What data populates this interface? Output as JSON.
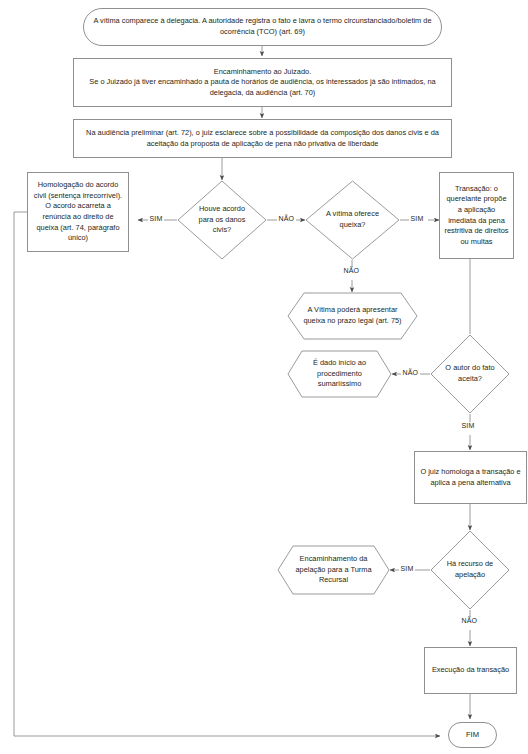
{
  "diagram": {
    "stroke_color": "#8d8f91",
    "text_color": "#231f20",
    "background": "#ffffff"
  },
  "nodes": {
    "start": {
      "shape": "pill",
      "text": "A vítima comparece à delegacia. A autoridade registra o fato e lavra o termo circunstanciado/boletim de ocorrência (TCO) (art. 69)"
    },
    "encaminhamento": {
      "shape": "rect",
      "text": "Encaminhamento ao Juizado.\nSe o Juizado já tiver encaminhado a pauta de horários de audiência, os interessados já são intimados, na delegacia, da audiência (art. 70)"
    },
    "audiencia_preliminar": {
      "shape": "rect",
      "text": "Na audiência preliminar (art. 72), o juiz esclarece sobre a possibilidade da composição dos danos civis e da aceitação da proposta de aplicação de pena não privativa de liberdade"
    },
    "homologacao": {
      "shape": "rect",
      "text": "Homologação do acordo civil (sentença irrecorrível). O acordo acarreta a renúncia ao direito de queixa (art. 74, parágrafo único)"
    },
    "houve_acordo": {
      "shape": "diamond",
      "text": "Houve acordo para os danos civis?"
    },
    "oferece_queixa": {
      "shape": "diamond",
      "text": "A vítima oferece queixa?"
    },
    "transacao": {
      "shape": "rect",
      "text": "Transação: o querelante propõe a aplicação imediata da pena restritiva de direitos ou multas"
    },
    "vitima_podera": {
      "shape": "hexagon",
      "text": "A Vítima poderá apresentar queixa no prazo legal (art. 75)"
    },
    "dado_inicio": {
      "shape": "hexagon",
      "text": "É dado início ao procedimento sumariíssimo"
    },
    "autor_aceita": {
      "shape": "diamond",
      "text": "O autor do fato aceita?"
    },
    "juiz_homologa": {
      "shape": "rect",
      "text": "O juiz homologa a transação e aplica a pena alternativa"
    },
    "encaminhamento_apelacao": {
      "shape": "hexagon",
      "text": "Encaminhamento da apelação para a Turma Recursal"
    },
    "ha_recurso": {
      "shape": "diamond",
      "text": "Há recurso de apelação"
    },
    "execucao": {
      "shape": "rect",
      "text": "Execução da transação"
    },
    "fim": {
      "shape": "pill",
      "text": "FIM"
    }
  },
  "edge_labels": {
    "acordo_sim": "SIM",
    "acordo_nao": "NÃO",
    "queixa_sim": "SIM",
    "queixa_nao": "NÃO",
    "aceita_nao": "NÃO",
    "aceita_sim": "SIM",
    "recurso_sim": "SIM",
    "recurso_nao": "NÃO"
  }
}
